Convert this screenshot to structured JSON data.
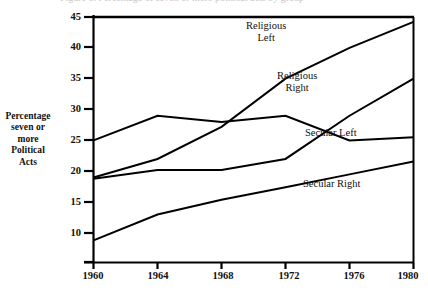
{
  "figure": {
    "clipped_title": "Figure 1. Percentage of seven or more political acts by group",
    "y_axis_title_lines": [
      "Percentage",
      "seven or",
      "more",
      "Political",
      "Acts"
    ]
  },
  "chart_data": {
    "type": "line",
    "title": "",
    "xlabel": "",
    "ylabel": "Percentage seven or more Political Acts",
    "x": [
      1960,
      1964,
      1968,
      1972,
      1976,
      1980
    ],
    "xtick_labels": [
      "1960",
      "1964",
      "1968",
      "1972",
      "1976",
      "1980"
    ],
    "ytick_labels": [
      "10",
      "15",
      "20",
      "25",
      "30",
      "35",
      "40",
      "45"
    ],
    "yticks": [
      10,
      15,
      20,
      25,
      30,
      35,
      40,
      45
    ],
    "ylim": [
      5,
      45
    ],
    "xlim": [
      1960,
      1980
    ],
    "grid": false,
    "legend": "inline-annotations",
    "line_color": "#000000",
    "series": [
      {
        "name": "Religious Left",
        "values": [
          19.0,
          22.0,
          27.2,
          35.0,
          40.0,
          44.2
        ],
        "label_lines": [
          "Religious",
          "Left"
        ]
      },
      {
        "name": "Religious Right",
        "values": [
          18.8,
          20.2,
          20.2,
          22.0,
          29.0,
          35.0
        ],
        "label_lines": [
          "Religious",
          "Right"
        ]
      },
      {
        "name": "Secular Left",
        "values": [
          25.0,
          29.0,
          28.0,
          29.0,
          25.0,
          25.5
        ],
        "label_lines": [
          "Secular Left"
        ]
      },
      {
        "name": "Secular Right",
        "values": [
          8.8,
          13.0,
          15.4,
          17.4,
          19.5,
          21.6
        ],
        "label_lines": [
          "Secular Right"
        ]
      }
    ]
  }
}
